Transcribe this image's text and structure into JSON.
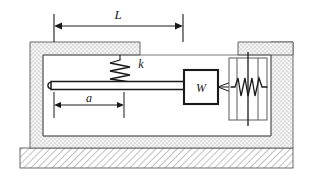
{
  "figure": {
    "labels": {
      "length_total": "L",
      "length_partial": "a",
      "spring_stiffness": "k",
      "mass_weight": "W"
    },
    "colors": {
      "line": "#1a1a1a",
      "housing_fill": "#efefef",
      "housing_stipple": "#9a9a9a",
      "ground_hatch": "#8c8c8c",
      "background": "#ffffff",
      "rod_fill": "#ffffff"
    },
    "elements": {
      "dimension_L": {
        "name": "L",
        "x_start": 54,
        "x_end": 183,
        "y": 26
      },
      "dimension_a": {
        "name": "a",
        "x_start": 54,
        "x_end": 124,
        "y": 105
      },
      "spring_k": {
        "name": "k",
        "x": 120,
        "y_top": 56,
        "y_bottom": 88,
        "coils": 5,
        "orientation": "vertical"
      },
      "block_W": {
        "name": "W",
        "x": 184,
        "y": 70,
        "width": 34,
        "height": 34
      },
      "damper": {
        "name": "damper-spring",
        "x": 229,
        "y": 58,
        "width": 38,
        "height": 62,
        "coils": 4,
        "orientation": "horizontal"
      },
      "rod": {
        "x_start": 50,
        "x_end": 184,
        "y": 85,
        "thickness": 8
      },
      "ground": {
        "x": 20,
        "y": 148,
        "width": 273,
        "height": 20,
        "pattern": "diagonal-hatch"
      },
      "housing_left": {
        "x": 30,
        "y": 42,
        "width": 110,
        "height": 106
      },
      "housing_right": {
        "x": 238,
        "y": 42,
        "width": 55,
        "height": 106
      }
    }
  }
}
